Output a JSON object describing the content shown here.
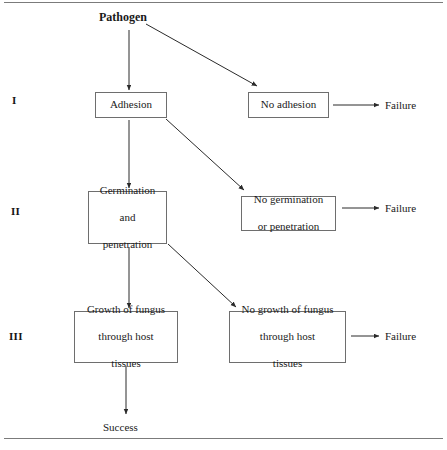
{
  "figure": {
    "type": "flowchart",
    "orientation": "top-to-bottom",
    "title_text": "Pathogen",
    "outcome_success": "Success",
    "rules": {
      "top": "horizontal-rule",
      "bottom": "horizontal-rule"
    }
  },
  "stages": [
    {
      "numeral": "I",
      "label_x": 12,
      "label_y": 94
    },
    {
      "numeral": "II",
      "label_x": 11,
      "label_y": 205
    },
    {
      "numeral": "III",
      "label_x": 9,
      "label_y": 330
    }
  ],
  "nodes": {
    "pathogen": {
      "text": "Pathogen",
      "kind": "text",
      "x": 99,
      "y": 11,
      "w": 62,
      "h": 15
    },
    "adhesion": {
      "text": "Adhesion",
      "kind": "box",
      "x": 95,
      "y": 92,
      "w": 72,
      "h": 26
    },
    "no_adhesion": {
      "text": "No adhesion",
      "kind": "box",
      "x": 248,
      "y": 92,
      "w": 81,
      "h": 26
    },
    "germination": {
      "line1": "Germination",
      "line2": "and",
      "line3": "penetration",
      "kind": "box",
      "x": 88,
      "y": 191,
      "w": 79,
      "h": 53
    },
    "no_germination": {
      "line1": "No germination",
      "line2": "or penetration",
      "kind": "box",
      "x": 241,
      "y": 196,
      "w": 95,
      "h": 35
    },
    "growth": {
      "line1": "Growth of fungus",
      "line2": "through host",
      "line3": "tissues",
      "kind": "box",
      "x": 74,
      "y": 311,
      "w": 104,
      "h": 52
    },
    "no_growth": {
      "line1": "No growth of fungus",
      "line2": "through host",
      "line3": "tissues",
      "kind": "box",
      "x": 229,
      "y": 311,
      "w": 117,
      "h": 52
    },
    "success": {
      "text": "Success",
      "kind": "text",
      "x": 103,
      "y": 421,
      "w": 50,
      "h": 14
    }
  },
  "failures": [
    {
      "text": "Failure",
      "x": 385,
      "y": 99
    },
    {
      "text": "Failure",
      "x": 385,
      "y": 202
    },
    {
      "text": "Failure",
      "x": 385,
      "y": 330
    }
  ],
  "edges": [
    {
      "name": "pathogen-to-adhesion",
      "from": [
        129,
        30
      ],
      "to": [
        129,
        90
      ],
      "kind": "vertical"
    },
    {
      "name": "pathogen-to-no-adhesion",
      "from": [
        146,
        24
      ],
      "to": [
        257,
        86
      ],
      "kind": "diagonal"
    },
    {
      "name": "adhesion-to-germination",
      "from": [
        129,
        120
      ],
      "to": [
        129,
        188
      ],
      "kind": "vertical"
    },
    {
      "name": "adhesion-to-no-germination",
      "from": [
        166,
        119
      ],
      "to": [
        244,
        190
      ],
      "kind": "diagonal"
    },
    {
      "name": "germination-to-growth",
      "from": [
        129,
        247
      ],
      "to": [
        129,
        308
      ],
      "kind": "vertical"
    },
    {
      "name": "germination-to-no-growth",
      "from": [
        168,
        244
      ],
      "to": [
        236,
        307
      ],
      "kind": "diagonal"
    },
    {
      "name": "growth-to-success",
      "from": [
        126,
        366
      ],
      "to": [
        126,
        414
      ],
      "kind": "vertical"
    },
    {
      "name": "no-adhesion-to-failure",
      "from": [
        333,
        105
      ],
      "to": [
        379,
        105
      ],
      "kind": "horizontal"
    },
    {
      "name": "no-germination-to-failure",
      "from": [
        342,
        208
      ],
      "to": [
        379,
        208
      ],
      "kind": "horizontal"
    },
    {
      "name": "no-growth-to-failure",
      "from": [
        351,
        336
      ],
      "to": [
        379,
        336
      ],
      "kind": "horizontal"
    }
  ],
  "colors": {
    "rule": "#7b7b7b",
    "box_border": "#6e6e6e",
    "edge": "#2a2a2a",
    "text": "#1a1a1a",
    "background": "#ffffff"
  }
}
